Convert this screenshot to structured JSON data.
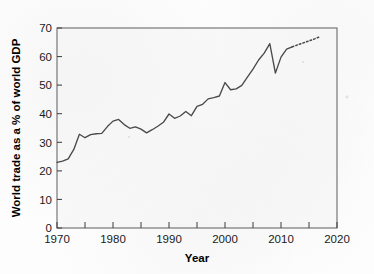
{
  "chart_data": {
    "type": "line",
    "title": "",
    "xlabel": "Year",
    "ylabel": "World trade as a % of world GDP",
    "xlim": [
      1970,
      2020
    ],
    "ylim": [
      0,
      70
    ],
    "grid": false,
    "legend": "none",
    "x_ticks": [
      1970,
      1980,
      1990,
      2000,
      2010,
      2020
    ],
    "x_tick_labels": [
      "1970",
      "1980",
      "1990",
      "2000",
      "2010",
      "2020"
    ],
    "x_minor_ticks": [
      1975,
      1985,
      1995,
      2005,
      2015
    ],
    "y_ticks": [
      0,
      10,
      20,
      30,
      40,
      50,
      60,
      70
    ],
    "y_tick_labels": [
      "0",
      "10",
      "20",
      "30",
      "40",
      "50",
      "60",
      "70"
    ],
    "series": [
      {
        "name": "World trade (actual)",
        "style": "solid",
        "color": "#4a4a4a",
        "x": [
          1970,
          1971,
          1972,
          1973,
          1974,
          1975,
          1976,
          1977,
          1978,
          1979,
          1980,
          1981,
          1982,
          1983,
          1984,
          1985,
          1986,
          1987,
          1988,
          1989,
          1990,
          1991,
          1992,
          1993,
          1994,
          1995,
          1996,
          1997,
          1998,
          1999,
          2000,
          2001,
          2002,
          2003,
          2004,
          2005,
          2006,
          2007,
          2008,
          2009,
          2010,
          2011,
          2012
        ],
        "values": [
          23.0,
          23.4,
          24.2,
          27.5,
          32.8,
          31.6,
          32.7,
          33.0,
          33.1,
          35.5,
          37.4,
          38.0,
          36.2,
          34.9,
          35.4,
          34.6,
          33.3,
          34.4,
          35.6,
          37.0,
          39.9,
          38.4,
          39.2,
          40.8,
          39.3,
          42.6,
          43.3,
          45.2,
          45.6,
          46.2,
          50.9,
          48.4,
          48.7,
          49.9,
          52.8,
          55.6,
          58.8,
          61.2,
          64.5,
          54.2,
          59.8,
          62.6,
          63.4
        ]
      },
      {
        "name": "World trade (projection)",
        "style": "dotted",
        "color": "#4a4a4a",
        "x": [
          2012,
          2013,
          2014,
          2015,
          2016,
          2017
        ],
        "values": [
          63.4,
          64.1,
          64.8,
          65.5,
          66.2,
          67.0
        ]
      }
    ]
  }
}
